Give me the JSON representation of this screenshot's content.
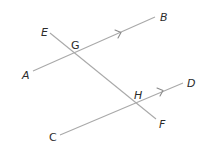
{
  "diagram": {
    "type": "parallel lines cut by a transversal",
    "line_color": "#a9a9a9",
    "label_color": "#2b2b2b",
    "lines": [
      {
        "name": "AB",
        "from": [
          33,
          71
        ],
        "to": [
          155,
          17
        ],
        "parallel_marker": true
      },
      {
        "name": "CD",
        "from": [
          60,
          135
        ],
        "to": [
          183,
          83
        ],
        "parallel_marker": true
      },
      {
        "name": "EF",
        "from": [
          50,
          33
        ],
        "to": [
          156,
          119
        ],
        "role": "transversal"
      }
    ],
    "points": {
      "A": {
        "label": "A",
        "x": 22,
        "y": 79
      },
      "B": {
        "label": "B",
        "x": 160,
        "y": 21
      },
      "C": {
        "label": "C",
        "x": 49,
        "y": 141
      },
      "D": {
        "label": "D",
        "x": 187,
        "y": 87
      },
      "E": {
        "label": "E",
        "x": 41,
        "y": 36
      },
      "F": {
        "label": "F",
        "x": 159,
        "y": 128
      },
      "G": {
        "label": "G",
        "x": 71,
        "y": 49
      },
      "H": {
        "label": "H",
        "x": 134,
        "y": 99
      }
    },
    "intersections": [
      {
        "name": "G",
        "x": 75,
        "y": 53
      },
      {
        "name": "H",
        "x": 138,
        "y": 103
      }
    ]
  }
}
